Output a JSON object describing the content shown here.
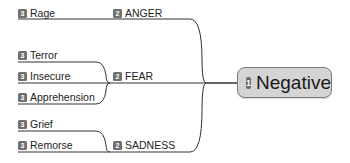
{
  "central": {
    "level": "1",
    "label": "Negative"
  },
  "branches": [
    {
      "level": "2",
      "label": "ANGER",
      "children": [
        {
          "level": "3",
          "label": "Rage"
        }
      ]
    },
    {
      "level": "2",
      "label": "FEAR",
      "children": [
        {
          "level": "3",
          "label": "Terror"
        },
        {
          "level": "3",
          "label": "Insecure"
        },
        {
          "level": "3",
          "label": "Apprehension"
        }
      ]
    },
    {
      "level": "2",
      "label": "SADNESS",
      "children": [
        {
          "level": "3",
          "label": "Grief"
        },
        {
          "level": "3",
          "label": "Remorse"
        }
      ]
    }
  ],
  "colors": {
    "line": "#333333",
    "badge": "#6f6f6f",
    "central_fill": "#d4d4d4",
    "central_border": "#7a7a7a"
  }
}
